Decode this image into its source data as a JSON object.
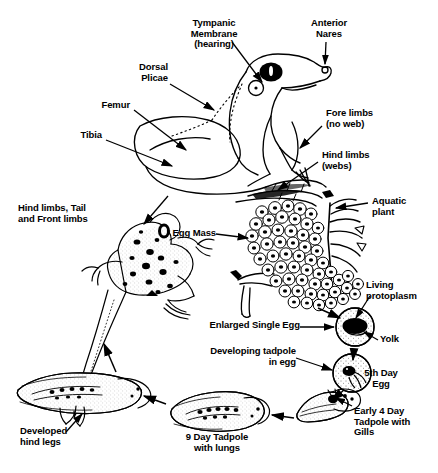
{
  "figure": {
    "type": "biology-diagram",
    "background_color": "#ffffff",
    "ink_color": "#000000"
  },
  "anatomy_labels": {
    "tympanic_membrane": "Tympanic\nMembrane\n(hearing)",
    "anterior_nares": "Anterior\nNares",
    "dorsal_plicae": "Dorsal\nPlicae",
    "femur": "Femur",
    "tibia": "Tibia",
    "fore_limbs": "Fore limbs\n(no web)",
    "hind_limbs": "Hind limbs\n(webs)"
  },
  "lifecycle_labels": {
    "froglet": "Hind limbs, Tail\nand Front limbs",
    "egg_mass": "Egg Mass",
    "aquatic_plant": "Aquatic\nplant",
    "living_protoplasm": "Living\nprotoplasm",
    "enlarged_single_egg": "Enlarged Single Egg",
    "yolk": "Yolk",
    "developing_tadpole": "Developing tadpole\nin egg",
    "fifth_day_egg": "5th Day\nEgg",
    "early_tadpole": "Early 4 Day\nTadpole with\nGills",
    "nine_day_tadpole": "9 Day Tadpole\nwith lungs",
    "developed_hind_legs": "Developed\nhind legs"
  },
  "icons": {
    "eye": "eye-icon",
    "nostril": "nostril-icon",
    "eardrum": "tympanic-membrane-icon",
    "arrow": "arrow-icon"
  }
}
